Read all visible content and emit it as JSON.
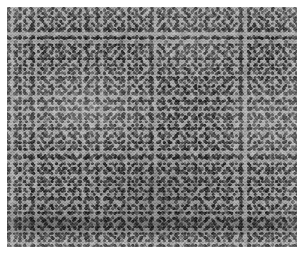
{
  "figure": {
    "kind": "histopathology-micrograph",
    "stain": "hematoxylin and eosin",
    "rendering": "grayscale",
    "label": "",
    "scale_bar_text": "",
    "annotations": []
  },
  "canvas": {
    "width_px": 307,
    "height_px": 255,
    "background_color": "#ffffff",
    "mat_margin_px": 7
  },
  "field": {
    "left_px": 7,
    "top_px": 7,
    "width_px": 290,
    "height_px": 240,
    "border_color": "#ffffff"
  },
  "appearance": {
    "base_tone_hex": "#9a9a9a",
    "nuclei_tone_hex": "#1a1a1a",
    "stroma_highlight_hex": "#e8e8e8",
    "shadow_tone_hex": "#4a4a4a",
    "pattern": "densely cellular, small hyperchromatic nuclei in short interlacing fascicles",
    "nucleus_size_px": 3,
    "bright_streak_regions": [
      "upper-left-center diagonal band",
      "right-center vertical band",
      "left-center swirl"
    ],
    "dark_band_region": "lower horizontal band near bottom edge"
  }
}
